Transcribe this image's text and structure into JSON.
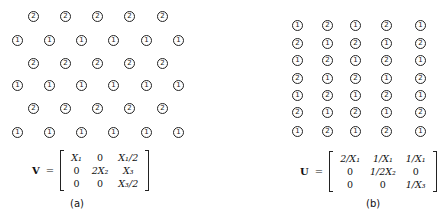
{
  "panel_a": {
    "caption": "(a)",
    "lattice": {
      "rows": [
        {
          "y": 16,
          "xs": [
            33,
            65,
            97,
            129,
            162
          ],
          "labels": [
            "2",
            "2",
            "2",
            "2",
            "2"
          ]
        },
        {
          "y": 40,
          "xs": [
            17,
            49,
            81,
            113,
            146,
            178
          ],
          "labels": [
            "1",
            "1",
            "1",
            "1",
            "1",
            "1"
          ]
        },
        {
          "y": 63,
          "xs": [
            33,
            65,
            97,
            129,
            162
          ],
          "labels": [
            "2",
            "2",
            "2",
            "2",
            "2"
          ]
        },
        {
          "y": 85,
          "xs": [
            17,
            49,
            81,
            113,
            146,
            178
          ],
          "labels": [
            "1",
            "1",
            "1",
            "1",
            "1",
            "1"
          ]
        },
        {
          "y": 108,
          "xs": [
            33,
            65,
            97,
            129,
            162
          ],
          "labels": [
            "2",
            "2",
            "2",
            "2",
            "2"
          ]
        },
        {
          "y": 132,
          "xs": [
            17,
            49,
            81,
            113,
            146,
            178
          ],
          "labels": [
            "1",
            "1",
            "1",
            "1",
            "1",
            "1"
          ]
        }
      ]
    },
    "equation": {
      "lhs": "V",
      "eq": "=",
      "matrix": [
        [
          "X₁",
          "0",
          "X₁/2"
        ],
        [
          "0",
          "2X₂",
          "X₃"
        ],
        [
          "0",
          "0",
          "X₃/2"
        ]
      ]
    }
  },
  "panel_b": {
    "caption": "(b)",
    "lattice": {
      "xs": [
        37,
        67,
        95,
        126,
        160
      ],
      "rows": [
        {
          "y": 25,
          "labels": [
            "1",
            "2",
            "1",
            "2",
            "1"
          ]
        },
        {
          "y": 43,
          "labels": [
            "2",
            "1",
            "2",
            "1",
            "2"
          ]
        },
        {
          "y": 60,
          "labels": [
            "1",
            "2",
            "1",
            "2",
            "1"
          ]
        },
        {
          "y": 78,
          "labels": [
            "2",
            "1",
            "2",
            "1",
            "2"
          ]
        },
        {
          "y": 95,
          "labels": [
            "1",
            "2",
            "1",
            "2",
            "1"
          ]
        },
        {
          "y": 112,
          "labels": [
            "2",
            "1",
            "2",
            "1",
            "2"
          ]
        },
        {
          "y": 131,
          "labels": [
            "1",
            "2",
            "1",
            "2",
            "1"
          ]
        }
      ]
    },
    "equation": {
      "lhs": "U",
      "eq": "=",
      "matrix": [
        [
          "2/X₁",
          "1/X₁",
          "1/X₁"
        ],
        [
          "0",
          "1/2X₂",
          "0"
        ],
        [
          "0",
          "0",
          "1/X₃"
        ]
      ]
    }
  }
}
